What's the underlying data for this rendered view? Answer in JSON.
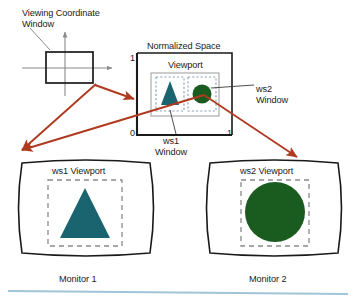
{
  "figure": {
    "background_color": "#ffffff"
  },
  "colors": {
    "triangle_teal": "#1a6470",
    "circle_green": "#1a5c1f",
    "arrow_red": "#b03a20",
    "outline_black": "#1a1a1a",
    "axis_gray": "#8a8a8a",
    "dashed_blue_gray": "#8fa6b8",
    "footer_rule_blue": "#9fc4d8"
  },
  "viewing_coordinate_window": {
    "label": "Viewing Coordinate\nWindow",
    "label_line1": "Viewing Coordinate",
    "label_line2": "Window",
    "shape": "rectangle",
    "axes": "cartesian-cross"
  },
  "normalized_space": {
    "title": "Normalized Space",
    "axis_labels": {
      "top_left": "1",
      "bottom_left": "0",
      "bottom_right": "1"
    },
    "viewport": {
      "title": "Viewport",
      "windows": [
        {
          "name": "ws1",
          "callout_line1": "ws1",
          "callout_line2": "Window",
          "shape": "triangle",
          "color": "#1a6470"
        },
        {
          "name": "ws2",
          "callout_line1": "ws2",
          "callout_line2": "Window",
          "shape": "circle",
          "color": "#1a5c1f"
        }
      ]
    }
  },
  "monitors": [
    {
      "viewport_label": "ws1 Viewport",
      "caption": "Monitor 1",
      "shape": "triangle",
      "color": "#1a6470"
    },
    {
      "viewport_label": "ws2 Viewport",
      "caption": "Monitor 2",
      "shape": "circle",
      "color": "#1a5c1f"
    }
  ],
  "annotations": {
    "arrow_count": 4,
    "arrow_color": "#b03a20"
  }
}
